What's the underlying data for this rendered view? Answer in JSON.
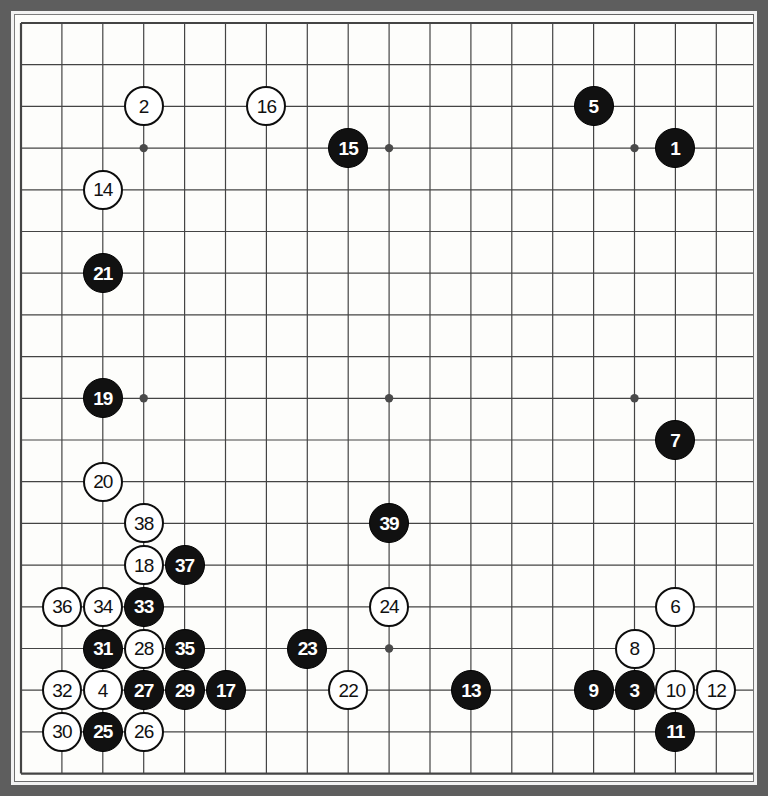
{
  "figure": {
    "type": "go-game-record",
    "board_size": 19,
    "frame_color": "#5e5e5e",
    "board_color": "#fdfdfb",
    "line_color": "#444444",
    "black_stone_color": "#111111",
    "white_stone_color": "#ffffff"
  },
  "grid": {
    "origin_x": 6,
    "origin_y": 8,
    "spacing_x": 40.9,
    "spacing_y": 41.7,
    "lines": 19,
    "star_points": [
      {
        "col": 3,
        "row": 3
      },
      {
        "col": 9,
        "row": 3
      },
      {
        "col": 15,
        "row": 3
      },
      {
        "col": 3,
        "row": 9
      },
      {
        "col": 9,
        "row": 9
      },
      {
        "col": 15,
        "row": 9
      },
      {
        "col": 3,
        "row": 15
      },
      {
        "col": 9,
        "row": 15
      },
      {
        "col": 15,
        "row": 15
      }
    ]
  },
  "moves": [
    {
      "n": "1",
      "color": "black",
      "col": 16,
      "row": 3
    },
    {
      "n": "2",
      "color": "white",
      "col": 3,
      "row": 2
    },
    {
      "n": "3",
      "color": "black",
      "col": 15,
      "row": 16
    },
    {
      "n": "4",
      "color": "white",
      "col": 2,
      "row": 16
    },
    {
      "n": "5",
      "color": "black",
      "col": 14,
      "row": 2
    },
    {
      "n": "6",
      "color": "white",
      "col": 16,
      "row": 14
    },
    {
      "n": "7",
      "color": "black",
      "col": 16,
      "row": 10
    },
    {
      "n": "8",
      "color": "white",
      "col": 15,
      "row": 15
    },
    {
      "n": "9",
      "color": "black",
      "col": 14,
      "row": 16
    },
    {
      "n": "10",
      "color": "white",
      "col": 16,
      "row": 16
    },
    {
      "n": "11",
      "color": "black",
      "col": 16,
      "row": 17
    },
    {
      "n": "12",
      "color": "white",
      "col": 17,
      "row": 16
    },
    {
      "n": "13",
      "color": "black",
      "col": 11,
      "row": 16
    },
    {
      "n": "14",
      "color": "white",
      "col": 2,
      "row": 4
    },
    {
      "n": "15",
      "color": "black",
      "col": 8,
      "row": 3
    },
    {
      "n": "16",
      "color": "white",
      "col": 6,
      "row": 2
    },
    {
      "n": "17",
      "color": "black",
      "col": 5,
      "row": 16
    },
    {
      "n": "18",
      "color": "white",
      "col": 3,
      "row": 13
    },
    {
      "n": "19",
      "color": "black",
      "col": 2,
      "row": 9
    },
    {
      "n": "20",
      "color": "white",
      "col": 2,
      "row": 11
    },
    {
      "n": "21",
      "color": "black",
      "col": 2,
      "row": 6
    },
    {
      "n": "22",
      "color": "white",
      "col": 8,
      "row": 16
    },
    {
      "n": "23",
      "color": "black",
      "col": 7,
      "row": 15
    },
    {
      "n": "24",
      "color": "white",
      "col": 9,
      "row": 14
    },
    {
      "n": "25",
      "color": "black",
      "col": 2,
      "row": 17
    },
    {
      "n": "26",
      "color": "white",
      "col": 3,
      "row": 17
    },
    {
      "n": "27",
      "color": "black",
      "col": 3,
      "row": 16
    },
    {
      "n": "28",
      "color": "white",
      "col": 3,
      "row": 15
    },
    {
      "n": "29",
      "color": "black",
      "col": 4,
      "row": 16
    },
    {
      "n": "30",
      "color": "white",
      "col": 1,
      "row": 17
    },
    {
      "n": "31",
      "color": "black",
      "col": 2,
      "row": 15
    },
    {
      "n": "32",
      "color": "white",
      "col": 1,
      "row": 16
    },
    {
      "n": "33",
      "color": "black",
      "col": 3,
      "row": 14
    },
    {
      "n": "34",
      "color": "white",
      "col": 2,
      "row": 14
    },
    {
      "n": "35",
      "color": "black",
      "col": 4,
      "row": 15
    },
    {
      "n": "36",
      "color": "white",
      "col": 1,
      "row": 14
    },
    {
      "n": "37",
      "color": "black",
      "col": 4,
      "row": 13
    },
    {
      "n": "38",
      "color": "white",
      "col": 3,
      "row": 12
    },
    {
      "n": "39",
      "color": "black",
      "col": 9,
      "row": 12
    }
  ]
}
